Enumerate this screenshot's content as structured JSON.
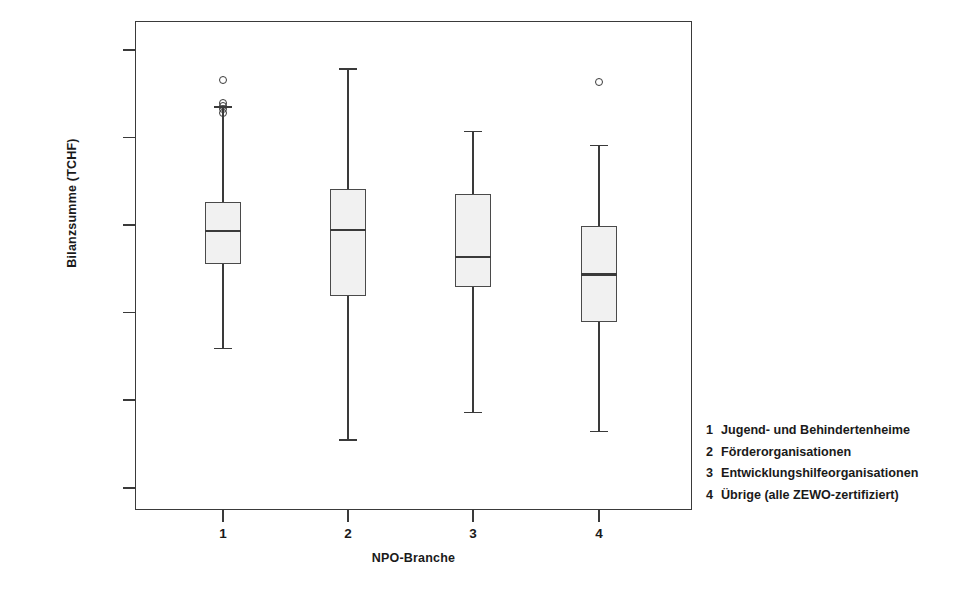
{
  "figure": {
    "background": "#ffffff",
    "frame_color": "#3a3a3a",
    "box_fill": "#f1f1f1"
  },
  "axes": {
    "y_title": "Bilanzsumme (TCHF)",
    "x_title": "NPO-Branche",
    "y_ticks": [
      {
        "label": "1 000 000",
        "value": 1000000
      },
      {
        "label": "100 000",
        "value": 100000
      },
      {
        "label": "10 000",
        "value": 10000
      },
      {
        "label": "1 000",
        "value": 1000
      },
      {
        "label": "100",
        "value": 100
      },
      {
        "label": "10",
        "value": 10
      }
    ],
    "x_ticks": [
      {
        "label": "1"
      },
      {
        "label": "2"
      },
      {
        "label": "3"
      },
      {
        "label": "4"
      }
    ]
  },
  "legend": {
    "entries": [
      {
        "key": "1",
        "text": "Jugend- und Behindertenheime"
      },
      {
        "key": "2",
        "text": "Förderorganisationen"
      },
      {
        "key": "3",
        "text": "Entwicklungshilfeorganisationen"
      },
      {
        "key": "4",
        "text": "Übrige (alle ZEWO-zertifiziert)"
      }
    ]
  },
  "chart_data": {
    "type": "boxplot",
    "title": "",
    "xlabel": "NPO-Branche",
    "ylabel": "Bilanzsumme (TCHF)",
    "yscale": "log",
    "ylim": [
      5,
      2000000
    ],
    "grid": false,
    "legend_position": "right-bottom-outside",
    "categories": [
      "1",
      "2",
      "3",
      "4"
    ],
    "category_labels": [
      "Jugend- und Behindertenheime",
      "Förderorganisationen",
      "Entwicklungshilfeorganisationen",
      "Übrige (alle ZEWO-zertifiziert)"
    ],
    "boxes": [
      {
        "category": "1",
        "whisker_low": 400,
        "q1": 3600,
        "median": 8600,
        "q3": 18500,
        "whisker_high": 230000,
        "outliers": [
          450000,
          250000,
          230000,
          210000,
          190000
        ]
      },
      {
        "category": "2",
        "whisker_low": 36,
        "q1": 1550,
        "median": 8800,
        "q3": 26000,
        "whisker_high": 620000,
        "outliers": []
      },
      {
        "category": "3",
        "whisker_low": 74,
        "q1": 1950,
        "median": 4300,
        "q3": 22500,
        "whisker_high": 120000,
        "outliers": []
      },
      {
        "category": "4",
        "whisker_low": 45,
        "q1": 780,
        "median": 2750,
        "q3": 9700,
        "whisker_high": 83000,
        "outliers": [
          430000
        ]
      }
    ]
  }
}
